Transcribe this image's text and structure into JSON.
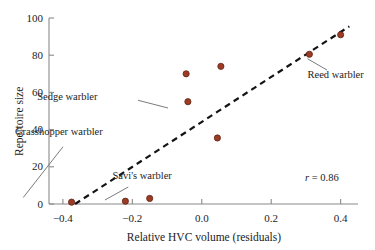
{
  "chart_data": {
    "type": "scatter",
    "title": "",
    "subtitle": "",
    "xlabel": "Relative HVC volume (residuals)",
    "ylabel": "Repertoire size",
    "xlim": [
      -0.44,
      0.45
    ],
    "ylim": [
      0,
      100
    ],
    "xticks": [
      -0.4,
      -0.2,
      0.0,
      0.2,
      0.4
    ],
    "xtick_labels": [
      "−0.4",
      "−0.2",
      "0.0",
      "0.2",
      "0.4"
    ],
    "yticks": [
      0,
      20,
      40,
      60,
      80,
      100
    ],
    "ytick_labels": [
      "0",
      "20",
      "40",
      "60",
      "80",
      "100"
    ],
    "grid": false,
    "legend": "none",
    "point_color": "#9e3b24",
    "point_edge_color": "#5e2414",
    "points": [
      {
        "x": -0.375,
        "y": 1.0,
        "label": "Grasshopper warbler"
      },
      {
        "x": -0.22,
        "y": 1.5,
        "label": "Savi's warbler"
      },
      {
        "x": -0.15,
        "y": 3.0,
        "label": ""
      },
      {
        "x": -0.045,
        "y": 70.0,
        "label": ""
      },
      {
        "x": -0.04,
        "y": 55.0,
        "label": "Sedge warbler"
      },
      {
        "x": 0.045,
        "y": 35.5,
        "label": ""
      },
      {
        "x": 0.055,
        "y": 74.0,
        "label": ""
      },
      {
        "x": 0.31,
        "y": 80.5,
        "label": "Reed warbler"
      },
      {
        "x": 0.4,
        "y": 91.0,
        "label": ""
      }
    ],
    "trendline": {
      "style": "dashed",
      "color": "#141414",
      "x_start": -0.365,
      "y_start": 0.0,
      "x_end": 0.425,
      "y_end": 95.5
    },
    "annotations": [
      {
        "text": "Sedge warbler",
        "text_x": 0.084,
        "text_y": 0.392,
        "anchor": "end",
        "leader_from": [
          0.368,
          0.401
        ],
        "leader_to": [
          0.448,
          0.432
        ]
      },
      {
        "text": "Grasshopper warbler",
        "text_x": 0.04,
        "text_y": 0.53,
        "anchor": "start",
        "leader_from": [
          0.168,
          0.587
        ],
        "leader_to": [
          0.062,
          0.79
        ]
      },
      {
        "text": "Savi's warbler",
        "text_x": 0.3,
        "text_y": 0.708,
        "anchor": "start",
        "leader_from": [
          0.342,
          0.748
        ],
        "leader_to": [
          0.28,
          0.8
        ]
      },
      {
        "text": "Reed warbler",
        "text_x": 0.82,
        "text_y": 0.302,
        "anchor": "start",
        "leader_from": [
          0.872,
          0.28
        ],
        "leader_to": [
          0.82,
          0.235
        ]
      }
    ],
    "stat_annotation": {
      "symbol": "r",
      "relation": " = ",
      "value": "0.86",
      "full_text": "r = 0.86"
    }
  },
  "geometry": {
    "plot_left": 49,
    "plot_right": 358,
    "plot_top": 18,
    "plot_bottom": 204
  }
}
